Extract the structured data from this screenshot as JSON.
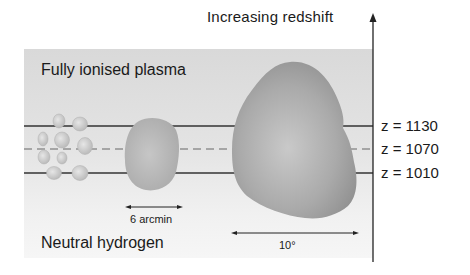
{
  "figure": {
    "axis_label": "Increasing redshift",
    "regions": {
      "top": "Fully ionised plasma",
      "bottom": "Neutral hydrogen"
    },
    "redshift_lines": [
      {
        "label": "z = 1130",
        "style": "solid"
      },
      {
        "label": "z = 1070",
        "style": "dashed"
      },
      {
        "label": "z = 1010",
        "style": "solid"
      }
    ],
    "scale_bars": [
      {
        "label": "6 arcmin"
      },
      {
        "label": "10°"
      }
    ],
    "colors": {
      "panel_top": "#d9d9d9",
      "panel_bottom": "#f6f6f6",
      "blob_fill": "#a8a8a8",
      "line": "#333333"
    }
  }
}
